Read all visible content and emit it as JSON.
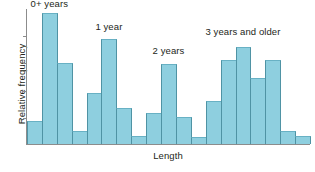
{
  "chart_data": {
    "type": "bar",
    "title": "",
    "subtitle": "",
    "xlabel": "Length",
    "ylabel": "Relative frequency",
    "grid": false,
    "legend_position": "none",
    "axis_tick_labels": {
      "x": [],
      "y": []
    },
    "ylim": [
      0,
      1
    ],
    "xlim": [
      0,
      19
    ],
    "bar_color": "#8ecfdf",
    "bar_edge_color": "#4f93a4",
    "axis_color": "#8c8c8c",
    "text_color": "#231f20",
    "background_color": "#ffffff",
    "categories": [
      "1",
      "2",
      "3",
      "4",
      "5",
      "6",
      "7",
      "8",
      "9",
      "10",
      "11",
      "12",
      "13",
      "14",
      "15",
      "16",
      "17",
      "18",
      "19"
    ],
    "values": [
      0.17,
      0.97,
      0.6,
      0.1,
      0.38,
      0.78,
      0.27,
      0.06,
      0.23,
      0.59,
      0.2,
      0.05,
      0.32,
      0.62,
      0.72,
      0.49,
      0.62,
      0.1,
      0.06
    ],
    "annotations": [
      {
        "text": "0+ years",
        "x_index": 1,
        "y": 1.0
      },
      {
        "text": "1 year",
        "x_index": 5,
        "y": 0.83
      },
      {
        "text": "2 years",
        "x_index": 9,
        "y": 0.65
      },
      {
        "text": "3 years and older",
        "x_index": 14,
        "y": 0.79
      }
    ],
    "y_tick_count": 4
  },
  "figure": {
    "ylabel": "Relative frequency",
    "xlabel": "Length",
    "annotations": [
      "0+ years",
      "1 year",
      "2 years",
      "3 years and older"
    ]
  }
}
